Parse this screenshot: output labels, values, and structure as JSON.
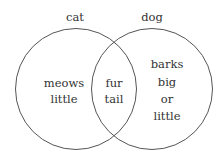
{
  "diagram": {
    "type": "venn",
    "sets": [
      {
        "label": "cat",
        "unique": [
          "meows",
          "little"
        ]
      },
      {
        "label": "dog",
        "unique": [
          "barks",
          "big",
          "or",
          "little"
        ]
      }
    ],
    "intersection": [
      "fur",
      "tail"
    ],
    "stroke_color": "#555555"
  }
}
